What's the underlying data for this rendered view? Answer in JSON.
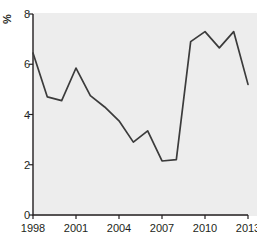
{
  "chart_data": {
    "type": "line",
    "title": "",
    "xlabel": "",
    "ylabel": "%",
    "x": [
      1998,
      1999,
      2000,
      2001,
      2002,
      2003,
      2004,
      2005,
      2006,
      2007,
      2008,
      2009,
      2010,
      2011,
      2012,
      2013
    ],
    "values": [
      6.45,
      4.7,
      4.55,
      5.85,
      4.75,
      4.3,
      3.75,
      2.9,
      3.35,
      2.15,
      2.2,
      6.9,
      7.3,
      6.65,
      7.3,
      5.2
    ],
    "series": [
      {
        "name": "%",
        "values": [
          6.45,
          4.7,
          4.55,
          5.85,
          4.75,
          4.3,
          3.75,
          2.9,
          3.35,
          2.15,
          2.2,
          6.9,
          7.3,
          6.65,
          7.3,
          5.2
        ]
      }
    ],
    "ylim": [
      0,
      8
    ],
    "xlim": [
      1998,
      2013
    ],
    "yticks": [
      0,
      2,
      4,
      6,
      8
    ],
    "ytick_labels": [
      "0",
      "2",
      "4",
      "6",
      "8"
    ],
    "xticks": [
      1998,
      2001,
      2004,
      2007,
      2010,
      2013
    ],
    "xtick_labels": [
      "1998",
      "2001",
      "2004",
      "2007",
      "2010",
      "2013"
    ],
    "grid": false,
    "legend": false,
    "line_color": "#3b3b3b",
    "plot_background": "#ededed",
    "figure_background": "#ffffff",
    "axis_color": "#231f20"
  }
}
